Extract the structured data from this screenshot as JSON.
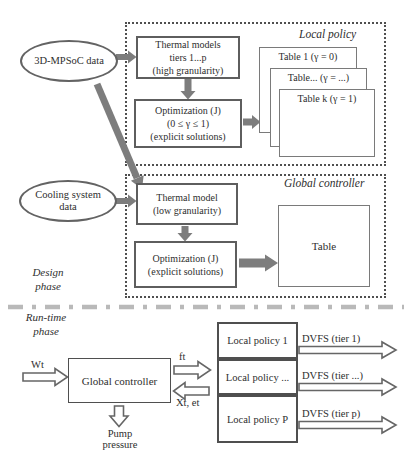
{
  "colors": {
    "box_border": "#5e5e5e",
    "solid_arrow_fill": "#7d7d7d",
    "outline_arrow_border": "#666666",
    "divider": "#b9b9b9",
    "text": "#2e2e2e"
  },
  "design_phase": {
    "phase_label": {
      "line1": "Design",
      "line2": "phase"
    },
    "inputs": {
      "mpsoc": "3D-MPSoC data",
      "cooling_line1": "Cooling system",
      "cooling_line2": "data"
    },
    "local_policy": {
      "title": "Local policy",
      "thermal_models": {
        "line1": "Thermal models",
        "line2": "tiers 1...p",
        "line3": "(high granularity)"
      },
      "optimization": {
        "line1": "Optimization (J)",
        "line2": "(0 ≤ γ ≤ 1)",
        "line3": "(explicit solutions)"
      },
      "tables": [
        {
          "label": "Table 1 (γ = 0)"
        },
        {
          "label": "Table... (γ = ...)"
        },
        {
          "label": "Table k (γ = 1)"
        }
      ]
    },
    "global_controller": {
      "title": "Global controller",
      "thermal_model": {
        "line1": "Thermal model",
        "line2": "(low granularity)"
      },
      "optimization": {
        "line1": "Optimization (J)",
        "line2": "(explicit solutions)"
      },
      "table": "Table"
    }
  },
  "run_time_phase": {
    "phase_label": {
      "line1": "Run-time",
      "line2": "phase"
    },
    "global_controller": "Global controller",
    "signals": {
      "input": "Wt",
      "output_freq": "ft",
      "feedback": "Xt, et",
      "pump_line1": "Pump",
      "pump_line2": "pressure"
    },
    "local_policies": [
      {
        "label": "Local policy 1",
        "output": "DVFS (tier 1)"
      },
      {
        "label": "Local policy ...",
        "output": "DVFS (tier ...)"
      },
      {
        "label": "Local policy P",
        "output": "DVFS (tier p)"
      }
    ]
  }
}
